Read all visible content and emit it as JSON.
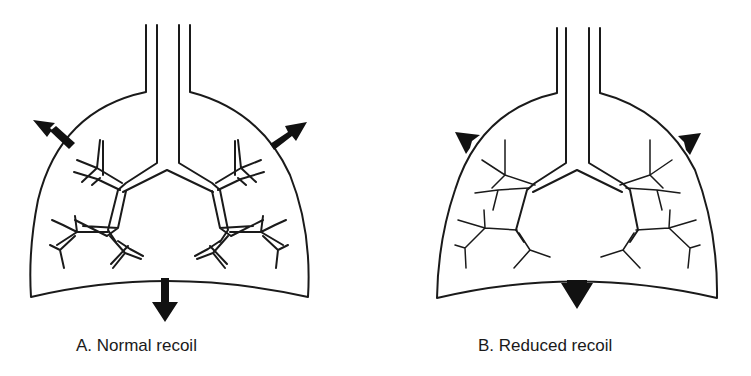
{
  "figure": {
    "panels": [
      {
        "id": "A",
        "caption": "A.  Normal recoil",
        "arrow_size": "large",
        "airway_style": "parallel-walled"
      },
      {
        "id": "B",
        "caption": "B.  Reduced recoil",
        "arrow_size": "small",
        "airway_style": "narrowed-tapered"
      }
    ],
    "colors": {
      "stroke": "#1a1a1a",
      "arrow_fill": "#111111",
      "background": "#ffffff"
    }
  }
}
